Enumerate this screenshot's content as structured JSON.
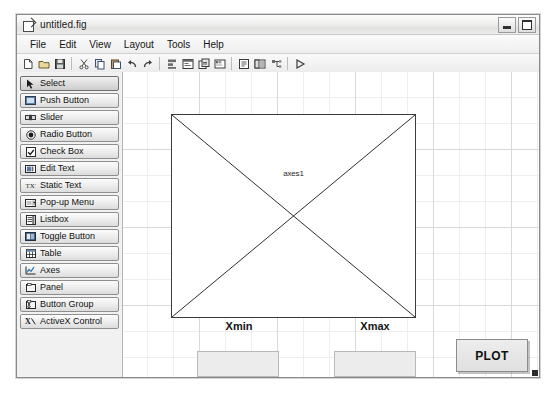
{
  "window": {
    "title": "untitled.fig",
    "icon": "figure-file-icon",
    "controls": [
      {
        "name": "minimize-button",
        "icon": "minimize-icon"
      },
      {
        "name": "maximize-button",
        "icon": "maximize-icon"
      }
    ]
  },
  "menubar": {
    "items": [
      {
        "label": "File"
      },
      {
        "label": "Edit"
      },
      {
        "label": "View"
      },
      {
        "label": "Layout"
      },
      {
        "label": "Tools"
      },
      {
        "label": "Help"
      }
    ]
  },
  "toolbar": {
    "groups": [
      [
        {
          "name": "new-figure-button",
          "icon": "new-file-icon"
        },
        {
          "name": "open-figure-button",
          "icon": "open-folder-icon"
        },
        {
          "name": "save-figure-button",
          "icon": "save-disk-icon"
        }
      ],
      [
        {
          "name": "cut-button",
          "icon": "scissors-icon"
        },
        {
          "name": "copy-button",
          "icon": "copy-icon"
        },
        {
          "name": "paste-button",
          "icon": "paste-icon"
        },
        {
          "name": "undo-button",
          "icon": "undo-arrow-icon"
        },
        {
          "name": "redo-button",
          "icon": "redo-arrow-icon"
        }
      ],
      [
        {
          "name": "align-objects-button",
          "icon": "align-objects-icon"
        },
        {
          "name": "menu-editor-button",
          "icon": "menu-editor-icon"
        },
        {
          "name": "tab-order-editor-button",
          "icon": "tab-order-icon"
        },
        {
          "name": "toolbar-editor-button",
          "icon": "toolbar-editor-icon"
        }
      ],
      [
        {
          "name": "m-file-editor-button",
          "icon": "m-file-editor-icon"
        },
        {
          "name": "property-inspector-button",
          "icon": "property-inspector-icon"
        },
        {
          "name": "object-browser-button",
          "icon": "object-browser-icon"
        }
      ],
      [
        {
          "name": "run-figure-button",
          "icon": "run-play-icon"
        }
      ]
    ]
  },
  "palette": {
    "items": [
      {
        "label": "Select",
        "icon": "arrow-pointer-icon",
        "selected": true
      },
      {
        "label": "Push Button",
        "icon": "push-button-icon",
        "selected": false
      },
      {
        "label": "Slider",
        "icon": "slider-icon",
        "selected": false
      },
      {
        "label": "Radio Button",
        "icon": "radio-button-icon",
        "selected": false
      },
      {
        "label": "Check Box",
        "icon": "check-box-icon",
        "selected": false
      },
      {
        "label": "Edit Text",
        "icon": "edit-text-icon",
        "selected": false
      },
      {
        "label": "Static Text",
        "icon": "static-text-icon",
        "selected": false
      },
      {
        "label": "Pop-up Menu",
        "icon": "popup-menu-icon",
        "selected": false
      },
      {
        "label": "Listbox",
        "icon": "listbox-icon",
        "selected": false
      },
      {
        "label": "Toggle Button",
        "icon": "toggle-button-icon",
        "selected": false
      },
      {
        "label": "Table",
        "icon": "table-icon",
        "selected": false
      },
      {
        "label": "Axes",
        "icon": "axes-chart-icon",
        "selected": false
      },
      {
        "label": "Panel",
        "icon": "panel-icon",
        "selected": false
      },
      {
        "label": "Button Group",
        "icon": "button-group-icon",
        "selected": false
      },
      {
        "label": "ActiveX Control",
        "icon": "activex-control-icon",
        "selected": false
      }
    ]
  },
  "canvas": {
    "axes": {
      "label": "axes1",
      "name": "axes-object"
    },
    "labels": {
      "xmin": "Xmin",
      "xmax": "Xmax"
    },
    "edits": {
      "xmin_value": "",
      "xmax_value": ""
    },
    "plot_button": {
      "label": "PLOT"
    }
  },
  "colors": {
    "window_bg": "#f2f2f2",
    "canvas_bg": "#ffffff",
    "grid_minor": "#eeeeee",
    "grid_major": "#d9d9d9",
    "axes_border": "#3b3b3b",
    "control_face": "#ececec"
  }
}
